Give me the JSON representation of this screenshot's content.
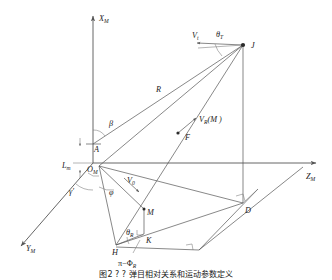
{
  "figure": {
    "type": "geometry-diagram",
    "background_color": "#ffffff",
    "line_color": "#555555",
    "label_color": "#222222",
    "caption": "图2 ? ? 弹目相对关系和运动参数定义"
  },
  "axes": {
    "x_label": "X",
    "x_sub": "M",
    "y_label": "Y",
    "y_sub": "M",
    "z_label": "Z",
    "z_sub": "M",
    "origin_label": "O",
    "origin_sub": "M"
  },
  "points": {
    "J": "J",
    "A": "A",
    "F": "F",
    "D": "D",
    "M": "M",
    "K": "K",
    "H": "H",
    "O": "O"
  },
  "vectors": {
    "vt": "V",
    "vt_sub": "t",
    "vr": "V",
    "vr_sub": "R",
    "vr_arg": "(M )",
    "v0": "V",
    "v0_sub": "0",
    "range": "R"
  },
  "angles": {
    "theta_T": "θ",
    "theta_T_sub": "T",
    "theta_R": "θ",
    "theta_R_sub": "R",
    "beta": "β",
    "gamma_prime": "γ′",
    "phi": "φ",
    "pi_minus_phi_R": "π−Φ",
    "pi_minus_phi_R_sub": "R"
  },
  "lengths": {
    "Lm": "L",
    "Lm_sub": "m"
  }
}
